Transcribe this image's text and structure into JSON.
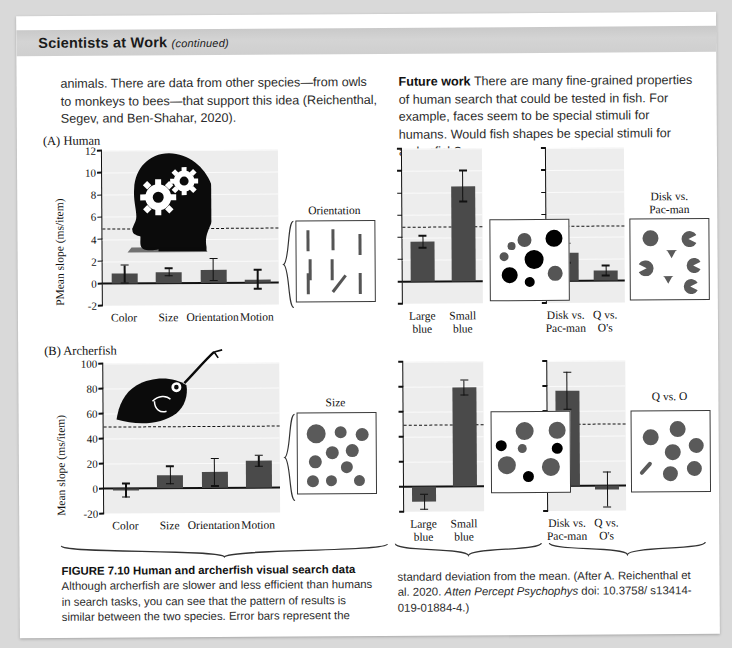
{
  "header": {
    "title": "Scientists at Work",
    "continued": "(continued)"
  },
  "body": {
    "left_paragraph": "animals. There are data from other species—from owls to monkeys to bees—that support this idea (Reichenthal, Segev, and Ben-Shahar, 2020).",
    "right_lead": "Future work",
    "right_paragraph": "There are many fine-grained properties of human search that could be tested in fish. For example, faces seem to be special stimuli for humans. Would fish shapes be special stimuli for archerfish?"
  },
  "panels": {
    "a": {
      "tag": "(A)",
      "name": "Human",
      "icon": "human-head-gears-icon"
    },
    "b": {
      "tag": "(B)",
      "name": "Archerfish",
      "icon": "archerfish-icon"
    }
  },
  "stimuli": [
    {
      "id": "orientation",
      "title": "Orientation",
      "kind": "lines"
    },
    {
      "id": "large-small-blue-a",
      "title": "",
      "kind": "disks-black"
    },
    {
      "id": "disk-pacman-a",
      "title": "Disk vs.\nPac-man",
      "kind": "pacman"
    },
    {
      "id": "size",
      "title": "Size",
      "kind": "disks-gray"
    },
    {
      "id": "large-small-blue-b",
      "title": "",
      "kind": "disks-mixed"
    },
    {
      "id": "q-vs-o",
      "title": "Q vs. O",
      "kind": "q-and-o"
    }
  ],
  "caption": {
    "figure_number": "FIGURE 7.10",
    "figure_title": "Human and archerfish visual search data",
    "text_left": "Although archerfish are slower and less efficient than humans in search tasks, you can see that the pattern of results is similar between the two species. Error bars represent the",
    "text_right_1": "standard deviation from the mean. (After A. Reichenthal",
    "text_right_2a": "et al. 2020. ",
    "text_right_2b": "Atten Percept Psychophys",
    "text_right_2c": " doi: 10.3758/",
    "text_right_3": "s13414-019-01884-4.)"
  },
  "colors": {
    "bar": "#4a4a4a",
    "plot_bg": "#ededed",
    "axis": "#111111",
    "header_band": "#cfcfcf",
    "page_bg": "#d9d9d9",
    "stim_gray": "#5a5a5a",
    "stim_black": "#000000"
  },
  "chart_data": [
    {
      "id": "human-feature-search",
      "type": "bar",
      "title": "(A) Human",
      "ylabel": "PMean slope (ms/item)",
      "xlabel": "",
      "ylim": [
        -2,
        12
      ],
      "yticks": [
        -2,
        0,
        2,
        4,
        6,
        8,
        10,
        12
      ],
      "grid": true,
      "reference_line": 5,
      "categories": [
        "Color",
        "Size",
        "Orientation",
        "Motion"
      ],
      "values": [
        0.85,
        1.0,
        1.2,
        0.3
      ],
      "errors": [
        0.8,
        0.35,
        1.0,
        0.85
      ]
    },
    {
      "id": "human-large-small-blue",
      "type": "bar",
      "title": "",
      "ylabel": "",
      "ylim": [
        -2,
        12
      ],
      "yticks": [
        -2,
        0,
        2,
        4,
        6,
        8,
        10,
        12
      ],
      "grid": true,
      "reference_line": 5,
      "categories": [
        "Large\nblue",
        "Small\nblue"
      ],
      "values": [
        3.6,
        8.6
      ],
      "errors": [
        0.55,
        1.4
      ]
    },
    {
      "id": "human-disk-pacman",
      "type": "bar",
      "title": "",
      "ylabel": "",
      "ylim": [
        -2,
        12
      ],
      "yticks": [
        -2,
        0,
        2,
        4,
        6,
        8,
        10,
        12
      ],
      "grid": true,
      "reference_line": 5,
      "categories": [
        "Disk vs.\nPac-man",
        "Q vs.\nO's"
      ],
      "values": [
        2.5,
        0.9
      ],
      "errors": [
        0.9,
        0.45
      ]
    },
    {
      "id": "archerfish-feature-search",
      "type": "bar",
      "title": "(B) Archerfish",
      "ylabel": "Mean slope (ms/item)",
      "xlabel": "",
      "ylim": [
        -20,
        100
      ],
      "yticks": [
        -20,
        0,
        20,
        40,
        60,
        80,
        100
      ],
      "grid": true,
      "reference_line": 50,
      "categories": [
        "Color",
        "Size",
        "Orientation",
        "Motion"
      ],
      "values": [
        -1.5,
        10.5,
        12.5,
        21.5
      ],
      "errors": [
        5.5,
        7.0,
        11.0,
        4.5
      ]
    },
    {
      "id": "archerfish-large-small-blue",
      "type": "bar",
      "title": "",
      "ylabel": "",
      "ylim": [
        -20,
        100
      ],
      "yticks": [
        -20,
        0,
        20,
        40,
        60,
        80,
        100
      ],
      "grid": true,
      "reference_line": 50,
      "categories": [
        "Large\nblue",
        "Small\nblue"
      ],
      "values": [
        -12,
        79
      ],
      "errors": [
        6,
        6
      ]
    },
    {
      "id": "archerfish-disk-pacman",
      "type": "bar",
      "title": "",
      "ylabel": "",
      "ylim": [
        -20,
        100
      ],
      "yticks": [
        -20,
        0,
        20,
        40,
        60,
        80,
        100
      ],
      "grid": true,
      "reference_line": 50,
      "categories": [
        "Disk vs.\nPac-man",
        "Q vs.\nO's"
      ],
      "values": [
        76,
        -3
      ],
      "errors": [
        15,
        14
      ]
    }
  ]
}
